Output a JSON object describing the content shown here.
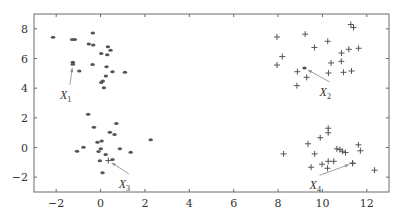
{
  "chart_data": {
    "type": "scatter",
    "title": "",
    "xlabel": "",
    "ylabel": "",
    "xlim": [
      -3,
      13
    ],
    "ylim": [
      -3,
      9
    ],
    "grid": false,
    "legend": null,
    "x_ticks": [
      -2,
      0,
      2,
      4,
      6,
      8,
      10,
      12
    ],
    "y_ticks": [
      -2,
      0,
      2,
      4,
      6,
      8
    ],
    "x_tick_labels": [
      "−2",
      "0",
      "2",
      "4",
      "6",
      "8",
      "10",
      "12"
    ],
    "y_tick_labels": [
      "−2",
      "0",
      "2",
      "4",
      "6",
      "8"
    ],
    "series": [
      {
        "name": "cluster-1",
        "marker": "dot",
        "points": [
          [
            -2.14,
            7.43
          ],
          [
            -1.28,
            7.28
          ],
          [
            -1.16,
            7.28
          ],
          [
            -0.35,
            7.72
          ],
          [
            -0.53,
            6.98
          ],
          [
            -0.33,
            6.91
          ],
          [
            0.33,
            6.8
          ],
          [
            0.45,
            6.55
          ],
          [
            0.03,
            6.33
          ],
          [
            0.3,
            6.26
          ],
          [
            -1.25,
            5.74
          ],
          [
            -0.36,
            5.6
          ],
          [
            0.27,
            5.45
          ],
          [
            -0.96,
            5.16
          ],
          [
            0.54,
            5.11
          ],
          [
            1.1,
            5.07
          ],
          [
            0.24,
            4.82
          ],
          [
            0.1,
            4.48
          ],
          [
            0.03,
            4.39
          ],
          [
            0.15,
            4.03
          ]
        ]
      },
      {
        "name": "cluster-2",
        "marker": "plus",
        "points": [
          [
            11.28,
            8.29
          ],
          [
            11.4,
            8.09
          ],
          [
            7.95,
            7.45
          ],
          [
            9.22,
            7.64
          ],
          [
            10.24,
            7.16
          ],
          [
            9.64,
            6.74
          ],
          [
            11.19,
            6.62
          ],
          [
            11.63,
            6.69
          ],
          [
            10.86,
            6.37
          ],
          [
            8.19,
            6.13
          ],
          [
            7.95,
            5.56
          ],
          [
            10.85,
            5.81
          ],
          [
            10.39,
            5.7
          ],
          [
            8.87,
            5.11
          ],
          [
            9.29,
            4.73
          ],
          [
            10.27,
            5.02
          ],
          [
            10.95,
            5.07
          ],
          [
            11.31,
            5.16
          ],
          [
            8.85,
            4.17
          ]
        ]
      },
      {
        "name": "cluster-3",
        "marker": "dot",
        "points": [
          [
            -0.56,
            2.25
          ],
          [
            0.71,
            1.62
          ],
          [
            -0.3,
            1.37
          ],
          [
            0.42,
            1.03
          ],
          [
            0.63,
            0.88
          ],
          [
            2.26,
            0.52
          ],
          [
            -0.14,
            0.36
          ],
          [
            0.05,
            0.43
          ],
          [
            -0.77,
            0.02
          ],
          [
            -1.06,
            -0.25
          ],
          [
            0.01,
            -0.09
          ],
          [
            -0.09,
            -0.27
          ],
          [
            0.87,
            -0.09
          ],
          [
            1.36,
            -0.32
          ],
          [
            0.23,
            -0.47
          ],
          [
            -0.03,
            -0.9
          ],
          [
            0.54,
            -0.81
          ],
          [
            0.09,
            -1.71
          ]
        ]
      },
      {
        "name": "cluster-4",
        "marker": "plus",
        "points": [
          [
            10.26,
            1.3
          ],
          [
            10.26,
            0.99
          ],
          [
            9.9,
            0.66
          ],
          [
            9.35,
            0.25
          ],
          [
            11.62,
            0.18
          ],
          [
            8.25,
            -0.43
          ],
          [
            9.65,
            -0.43
          ],
          [
            10.65,
            -0.09
          ],
          [
            10.79,
            -0.14
          ],
          [
            10.9,
            -0.25
          ],
          [
            11.04,
            -0.34
          ],
          [
            11.71,
            -0.22
          ],
          [
            10.26,
            -0.93
          ],
          [
            10.51,
            -0.93
          ],
          [
            9.98,
            -1.13
          ],
          [
            11.36,
            -1.06
          ],
          [
            9.49,
            -1.33
          ],
          [
            10.23,
            -1.4
          ],
          [
            12.35,
            -1.53
          ]
        ]
      }
    ],
    "annotations": [
      {
        "label": "X",
        "subscript": "1",
        "point": [
          -1.25,
          5.62
        ],
        "marker": "dot",
        "label_pos": [
          -1.65,
          3.55
        ]
      },
      {
        "label": "X",
        "subscript": "2",
        "point": [
          9.19,
          5.36
        ],
        "marker": "dot",
        "label_pos": [
          10.05,
          3.75
        ]
      },
      {
        "label": "X",
        "subscript": "3",
        "point": [
          0.35,
          -0.88
        ],
        "marker": "plus",
        "label_pos": [
          1.0,
          -2.45
        ]
      },
      {
        "label": "X",
        "subscript": "4",
        "point": [
          11.36,
          -1.06
        ],
        "marker": "plus",
        "label_pos": [
          9.6,
          -2.55
        ]
      }
    ]
  }
}
